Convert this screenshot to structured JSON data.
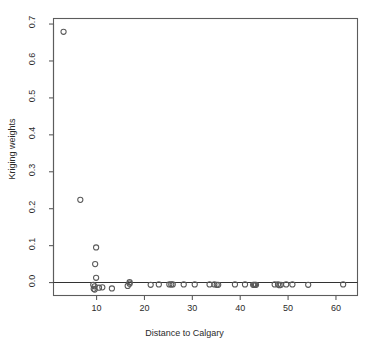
{
  "chart_data": {
    "type": "scatter",
    "title": "",
    "xlabel": "Distance to Calgary",
    "ylabel": "Kriging weights",
    "xlim": [
      1.0,
      64.5
    ],
    "ylim": [
      -0.035,
      0.715
    ],
    "xticks": [
      10,
      20,
      30,
      40,
      50,
      60
    ],
    "xtick_labels": [
      "10",
      "20",
      "30",
      "40",
      "50",
      "60"
    ],
    "yticks": [
      0.0,
      0.1,
      0.2,
      0.3,
      0.4,
      0.5,
      0.6,
      0.7
    ],
    "ytick_labels": [
      "0.0",
      "0.1",
      "0.2",
      "0.3",
      "0.4",
      "0.5",
      "0.6",
      "0.7"
    ],
    "grid": false,
    "legend": null,
    "reference_lines": [
      {
        "orientation": "horizontal",
        "y": 0.0,
        "color": "#333333"
      }
    ],
    "marker": {
      "shape": "open-circle",
      "radius": 2.6,
      "color": "#5a5a5a"
    },
    "points": [
      {
        "x": 3.1,
        "y": 0.679
      },
      {
        "x": 6.6,
        "y": 0.224
      },
      {
        "x": 9.9,
        "y": 0.095
      },
      {
        "x": 9.7,
        "y": 0.05
      },
      {
        "x": 9.9,
        "y": 0.013
      },
      {
        "x": 9.3,
        "y": -0.006
      },
      {
        "x": 9.6,
        "y": -0.01
      },
      {
        "x": 9.4,
        "y": -0.017
      },
      {
        "x": 9.6,
        "y": -0.019
      },
      {
        "x": 10.5,
        "y": -0.014
      },
      {
        "x": 11.2,
        "y": -0.013
      },
      {
        "x": 13.2,
        "y": -0.016
      },
      {
        "x": 16.5,
        "y": -0.009
      },
      {
        "x": 16.9,
        "y": 0.001
      },
      {
        "x": 16.9,
        "y": -0.003
      },
      {
        "x": 21.3,
        "y": -0.006
      },
      {
        "x": 23.0,
        "y": -0.005
      },
      {
        "x": 25.2,
        "y": -0.005
      },
      {
        "x": 25.6,
        "y": -0.005
      },
      {
        "x": 25.9,
        "y": -0.005
      },
      {
        "x": 28.2,
        "y": -0.005
      },
      {
        "x": 30.5,
        "y": -0.005
      },
      {
        "x": 33.6,
        "y": -0.005
      },
      {
        "x": 34.6,
        "y": -0.005
      },
      {
        "x": 35.1,
        "y": -0.006
      },
      {
        "x": 35.4,
        "y": -0.006
      },
      {
        "x": 38.9,
        "y": -0.005
      },
      {
        "x": 41.0,
        "y": -0.005
      },
      {
        "x": 42.7,
        "y": -0.006
      },
      {
        "x": 42.9,
        "y": -0.006
      },
      {
        "x": 43.1,
        "y": -0.006
      },
      {
        "x": 43.3,
        "y": -0.006
      },
      {
        "x": 47.2,
        "y": -0.005
      },
      {
        "x": 47.9,
        "y": -0.005
      },
      {
        "x": 48.2,
        "y": -0.007
      },
      {
        "x": 48.5,
        "y": -0.006
      },
      {
        "x": 49.6,
        "y": -0.005
      },
      {
        "x": 50.9,
        "y": -0.005
      },
      {
        "x": 54.2,
        "y": -0.006
      },
      {
        "x": 61.5,
        "y": -0.005
      }
    ]
  }
}
